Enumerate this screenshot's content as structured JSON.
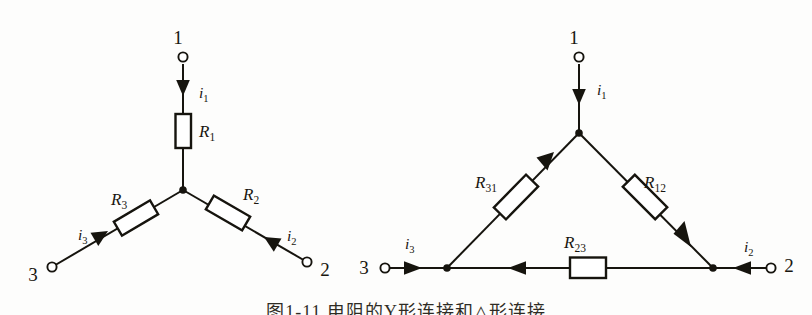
{
  "figure": {
    "background_color": "#fdfdfc",
    "ink_color": "#16140e",
    "caption": "图1-11  电阻的Y形连接和△形连接"
  },
  "diagrams": [
    {
      "id": "wye",
      "name": "Y-connection (star) of three resistors",
      "terminals": [
        {
          "label": "1",
          "x": 178,
          "y": 44
        },
        {
          "label": "2",
          "x": 325,
          "y": 276
        },
        {
          "label": "3",
          "x": 33,
          "y": 281
        }
      ],
      "resistors": [
        {
          "label": "R",
          "sub": "1",
          "label_x": 199,
          "label_y": 137
        },
        {
          "label": "R",
          "sub": "2",
          "label_x": 243,
          "label_y": 200
        },
        {
          "label": "R",
          "sub": "3",
          "label_x": 111,
          "label_y": 205
        }
      ],
      "currents": [
        {
          "label": "i",
          "sub": "1",
          "label_x": 199,
          "label_y": 98
        },
        {
          "label": "i",
          "sub": "2",
          "label_x": 287,
          "label_y": 241
        },
        {
          "label": "i",
          "sub": "3",
          "label_x": 78,
          "label_y": 240
        }
      ]
    },
    {
      "id": "delta",
      "name": "Delta-connection (mesh) of three resistors",
      "terminals": [
        {
          "label": "1",
          "x": 574,
          "y": 44
        },
        {
          "label": "2",
          "x": 789,
          "y": 272
        },
        {
          "label": "3",
          "x": 364,
          "y": 274
        }
      ],
      "resistors": [
        {
          "label": "R",
          "sub": "31",
          "label_x": 486,
          "label_y": 188
        },
        {
          "label": "R",
          "sub": "12",
          "label_x": 655,
          "label_y": 188
        },
        {
          "label": "R",
          "sub": "23",
          "label_x": 575,
          "label_y": 248
        }
      ],
      "currents": [
        {
          "label": "i",
          "sub": "1",
          "label_x": 597,
          "label_y": 95
        },
        {
          "label": "i",
          "sub": "2",
          "label_x": 744,
          "label_y": 252
        },
        {
          "label": "i",
          "sub": "3",
          "label_x": 405,
          "label_y": 249
        }
      ]
    }
  ]
}
